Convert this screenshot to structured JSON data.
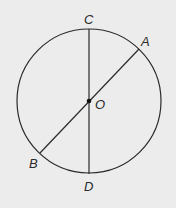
{
  "diagram": {
    "type": "circle-with-diameters",
    "background": "#ececec",
    "stroke_color": "#2a2a2a",
    "circle": {
      "cx": 89,
      "cy": 101,
      "r": 72
    },
    "center": {
      "label": "O",
      "x": 89,
      "y": 101
    },
    "points": [
      {
        "label": "C",
        "x": 89,
        "y": 29
      },
      {
        "label": "A",
        "x": 139,
        "y": 49
      },
      {
        "label": "B",
        "x": 40,
        "y": 153
      },
      {
        "label": "D",
        "x": 89,
        "y": 174
      }
    ],
    "segments": [
      {
        "from": "C",
        "to": "D"
      },
      {
        "from": "A",
        "to": "B"
      }
    ],
    "labels": {
      "C": "C",
      "A": "A",
      "O": "O",
      "B": "B",
      "D": "D"
    }
  }
}
